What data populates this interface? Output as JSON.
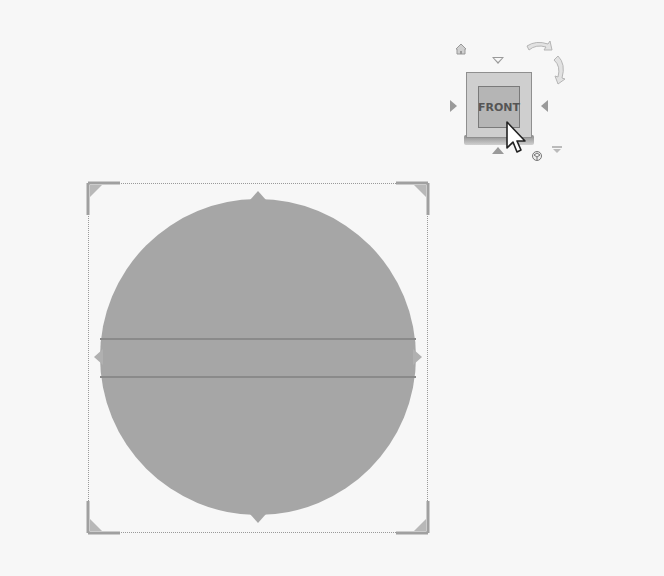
{
  "viewport": {
    "background": "#f7f7f7"
  },
  "viewcube": {
    "face_label": "FRONT",
    "icons": [
      "home-icon",
      "rotate-ccw-icon",
      "rotate-cw-icon",
      "arrow-up-icon",
      "arrow-down-icon",
      "arrow-left-icon",
      "arrow-right-icon",
      "viewcube-menu-icon"
    ]
  },
  "selection": {
    "shape": "circle",
    "fill_color": "#a6a6a6",
    "frame_style": "dotted",
    "handles": [
      "top",
      "bottom",
      "left",
      "right"
    ],
    "corners": [
      "top-left",
      "top-right",
      "bottom-left",
      "bottom-right"
    ]
  },
  "cursor": {
    "type": "arrow-pointer"
  }
}
